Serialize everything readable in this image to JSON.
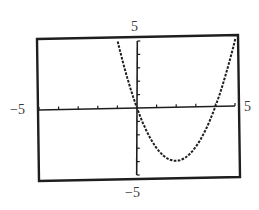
{
  "chart_data": {
    "type": "line",
    "title": "",
    "xlabel": "",
    "ylabel": "",
    "xlim": [
      -5,
      5
    ],
    "ylim": [
      -5,
      5
    ],
    "grid": false,
    "legend": null,
    "tick_labels": {
      "x_min": "−5",
      "x_max": "5",
      "y_min": "−5",
      "y_max": "5"
    },
    "x_tick_step": 1,
    "y_tick_step": 1,
    "series": [
      {
        "name": "y = x^2 - 4x",
        "style": "dotted pixel curve",
        "x": [
          -1,
          -0.5,
          0,
          0.5,
          1,
          1.5,
          2,
          2.5,
          3,
          3.5,
          4,
          4.5,
          5
        ],
        "y": [
          5,
          2.25,
          0,
          -1.75,
          -3,
          -3.75,
          -4,
          -3.75,
          -3,
          -1.75,
          0,
          2.25,
          5
        ]
      }
    ],
    "annotations": {
      "roots": [
        0,
        4
      ],
      "vertex": [
        2,
        -4
      ]
    }
  },
  "colors": {
    "ink": "#1e1e1e",
    "background": "#ffffff"
  }
}
